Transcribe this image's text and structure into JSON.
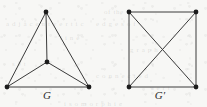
{
  "figure": {
    "width": 207,
    "height": 107,
    "background_color": "#f7f7f5",
    "edge_color": "#3a3a3a",
    "vertex_color": "#1c1c1c",
    "label_color": "#2b2b2b",
    "edge_width": 1,
    "vertex_radius": 2.4,
    "bleed_through_artifacts": [
      {
        "text": "of the",
        "x": 104,
        "y": 8
      },
      {
        "text": "a d j a c e n t  v e r t i c",
        "x": 6,
        "y": 20
      },
      {
        "text": "e d g e s  o f",
        "x": 96,
        "y": 20
      },
      {
        "text": "l  i  n  e",
        "x": 60,
        "y": 34
      },
      {
        "text": "g r a p h",
        "x": 130,
        "y": 46
      },
      {
        "text": "s e t",
        "x": 12,
        "y": 60
      },
      {
        "text": "c o n n e c t e d",
        "x": 96,
        "y": 72
      },
      {
        "text": "v e r t",
        "x": 150,
        "y": 84
      },
      {
        "text": "i s o m o r p h i c",
        "x": 64,
        "y": 100
      }
    ]
  },
  "graphs": [
    {
      "id": "graph-g",
      "label": "G",
      "label_position": {
        "x": 47,
        "y": 97
      },
      "description": "triangle with a central vertex joined to all three corners",
      "vertex_count": 4,
      "edge_count": 6,
      "vertices": [
        {
          "name": "apex",
          "x": 46,
          "y": 12
        },
        {
          "name": "bottom-left",
          "x": 7,
          "y": 87
        },
        {
          "name": "bottom-right",
          "x": 89,
          "y": 87
        },
        {
          "name": "center",
          "x": 47,
          "y": 62
        }
      ],
      "edges": [
        {
          "from": 0,
          "to": 1
        },
        {
          "from": 0,
          "to": 2
        },
        {
          "from": 1,
          "to": 2
        },
        {
          "from": 3,
          "to": 0
        },
        {
          "from": 3,
          "to": 1
        },
        {
          "from": 3,
          "to": 2
        }
      ]
    },
    {
      "id": "graph-g-prime",
      "label": "G′",
      "label_position": {
        "x": 160,
        "y": 97
      },
      "description": "square with both diagonals drawn, edges crossing at the middle",
      "vertex_count": 4,
      "edge_count": 6,
      "vertices": [
        {
          "name": "top-left",
          "x": 129,
          "y": 12
        },
        {
          "name": "top-right",
          "x": 196,
          "y": 12
        },
        {
          "name": "bottom-right",
          "x": 196,
          "y": 87
        },
        {
          "name": "bottom-left",
          "x": 129,
          "y": 87
        }
      ],
      "edges": [
        {
          "from": 0,
          "to": 1
        },
        {
          "from": 1,
          "to": 2
        },
        {
          "from": 2,
          "to": 3
        },
        {
          "from": 3,
          "to": 0
        },
        {
          "from": 0,
          "to": 2
        },
        {
          "from": 1,
          "to": 3
        }
      ]
    }
  ]
}
